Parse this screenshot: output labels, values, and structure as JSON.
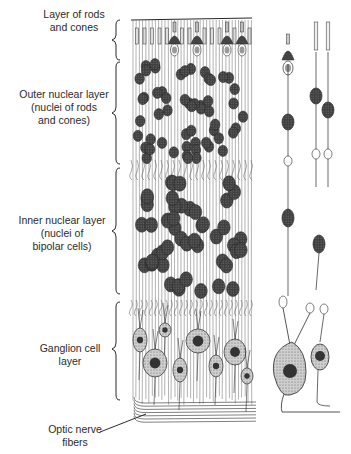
{
  "figure": {
    "labels": [
      {
        "id": "rods-cones",
        "text": "Layer of rods\nand cones"
      },
      {
        "id": "outer-nuclear",
        "text": "Outer nuclear layer\n(nuclei of rods\nand cones)"
      },
      {
        "id": "inner-nuclear",
        "text": "Inner nuclear layer\n(nuclei of\nbipolar cells)"
      },
      {
        "id": "ganglion",
        "text": "Ganglion cell\nlayer"
      },
      {
        "id": "optic-nerve",
        "text": "Optic nerve\nfibers"
      }
    ],
    "colors": {
      "ink": "#2a2a2a",
      "nucleus": "#4a4a4a",
      "cell_body": "#bdbdbd",
      "background": "#ffffff"
    }
  }
}
